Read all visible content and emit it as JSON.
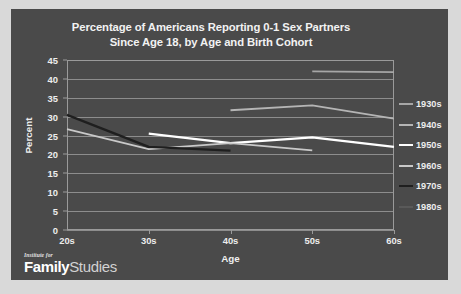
{
  "figure": {
    "background_color": "#d9d9d9",
    "panel_color": "#4a4a4a"
  },
  "logo": {
    "kicker": "Institute for",
    "word_bold": "Family",
    "word_light": "Studies"
  },
  "chart_data": {
    "type": "line",
    "title": "Percentage of Americans Reporting 0-1 Sex Partners Since Age 18, by Age and Birth Cohort",
    "title_line1": "Percentage of Americans Reporting 0-1 Sex Partners",
    "title_line2": "Since Age 18, by Age and Birth Cohort",
    "xlabel": "Age",
    "ylabel": "Percent",
    "categories": [
      "20s",
      "30s",
      "40s",
      "50s",
      "60s"
    ],
    "ylim": [
      0,
      45
    ],
    "yticks": [
      0,
      5,
      10,
      15,
      20,
      25,
      30,
      35,
      40,
      45
    ],
    "ytick_labels": [
      "0",
      "5",
      "10",
      "15",
      "20",
      "25",
      "30",
      "35",
      "40",
      "45"
    ],
    "grid": true,
    "grid_axis": "y",
    "legend_position": "right",
    "legend_title": "",
    "series": [
      {
        "name": "1930s",
        "color": "#a6a6a6",
        "width": 1.6,
        "values": [
          null,
          null,
          null,
          42.0,
          41.8
        ]
      },
      {
        "name": "1940s",
        "color": "#b5b5b5",
        "width": 1.8,
        "values": [
          null,
          null,
          31.7,
          33.0,
          29.5
        ]
      },
      {
        "name": "1950s",
        "color": "#ffffff",
        "width": 2.2,
        "values": [
          null,
          25.5,
          23.0,
          24.5,
          22.0
        ]
      },
      {
        "name": "1960s",
        "color": "#c9c9c9",
        "width": 1.7,
        "values": [
          26.7,
          21.4,
          23.0,
          21.1,
          null
        ]
      },
      {
        "name": "1970s",
        "color": "#1f1f1f",
        "width": 2.4,
        "values": [
          30.5,
          22.0,
          21.0,
          null,
          null
        ]
      },
      {
        "name": "1980s",
        "color": "#595959",
        "width": 1.5,
        "values": [
          null,
          null,
          null,
          null,
          null
        ]
      }
    ]
  }
}
